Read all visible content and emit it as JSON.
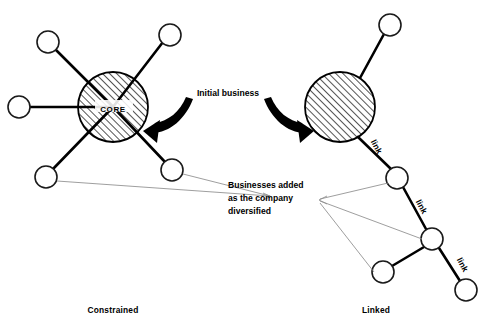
{
  "figure": {
    "background_color": "#ffffff",
    "ink_color": "#000000",
    "leader_color": "#8d8d8d",
    "width": 489,
    "height": 329
  },
  "labels": {
    "core": "CORE",
    "initial_business": "Initial business",
    "annotation_line1": "Businesses added",
    "annotation_line2": "as the company",
    "annotation_line3": "diversified",
    "link1": "link",
    "link2": "link",
    "link3": "link"
  },
  "captions": {
    "left": "Constrained",
    "right": "Linked"
  },
  "constrained": {
    "core": {
      "cx": 113,
      "cy": 107,
      "r": 35,
      "label": "CORE",
      "fill": "hatched"
    },
    "nodes": [
      {
        "name": "node-upper-left",
        "cx": 48,
        "cy": 42,
        "r": 11
      },
      {
        "name": "node-upper-right",
        "cx": 170,
        "cy": 35,
        "r": 11
      },
      {
        "name": "node-left",
        "cx": 19,
        "cy": 107,
        "r": 11
      },
      {
        "name": "node-lower-left",
        "cx": 46,
        "cy": 177,
        "r": 11
      },
      {
        "name": "node-lower-right",
        "cx": 172,
        "cy": 170,
        "r": 11
      }
    ],
    "edges": [
      {
        "from": "core",
        "to": "node-upper-left"
      },
      {
        "from": "core",
        "to": "node-upper-right"
      },
      {
        "from": "core",
        "to": "node-left"
      },
      {
        "from": "core",
        "to": "node-lower-left"
      },
      {
        "from": "core",
        "to": "node-lower-right"
      }
    ]
  },
  "linked": {
    "core": {
      "cx": 340,
      "cy": 107,
      "r": 35,
      "fill": "hatched"
    },
    "nodes": [
      {
        "name": "node-top",
        "cx": 390,
        "cy": 25,
        "r": 11
      },
      {
        "name": "node-chain-1",
        "cx": 397,
        "cy": 178,
        "r": 11
      },
      {
        "name": "node-chain-2",
        "cx": 432,
        "cy": 239,
        "r": 11
      },
      {
        "name": "node-branch-a",
        "cx": 383,
        "cy": 272,
        "r": 11
      },
      {
        "name": "node-branch-b",
        "cx": 466,
        "cy": 290,
        "r": 11
      }
    ],
    "edges": [
      {
        "from": "core",
        "to": "node-top",
        "label": ""
      },
      {
        "from": "core",
        "to": "node-chain-1",
        "label": "link"
      },
      {
        "from": "node-chain-1",
        "to": "node-chain-2",
        "label": "link"
      },
      {
        "from": "node-chain-2",
        "to": "node-branch-a",
        "label": ""
      },
      {
        "from": "node-chain-2",
        "to": "node-branch-b",
        "label": "link"
      }
    ]
  },
  "leaders": {
    "annotation_anchor": {
      "x": 270,
      "y": 196
    },
    "targets": [
      {
        "name": "leader-to-constrained-lower-left",
        "x": 57,
        "y": 181
      },
      {
        "name": "leader-to-constrained-lower-right",
        "x": 183,
        "y": 174
      },
      {
        "name": "leader-to-linked-chain-1",
        "x": 388,
        "y": 183
      },
      {
        "name": "leader-to-linked-chain-2",
        "x": 422,
        "y": 239
      },
      {
        "name": "leader-to-linked-branch-a",
        "x": 374,
        "y": 272
      }
    ]
  },
  "arrows": [
    {
      "name": "arrow-left-curved",
      "description": "curved black arrow pointing left into CORE"
    },
    {
      "name": "arrow-right-curved",
      "description": "curved black arrow pointing right into linked core"
    }
  ]
}
